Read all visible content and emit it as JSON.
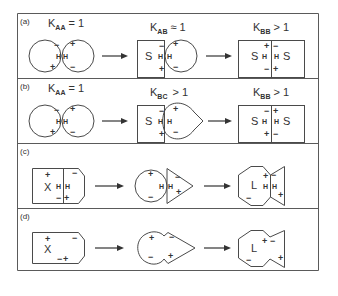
{
  "figure": {
    "panels": [
      {
        "id": "a",
        "label": "(a)",
        "steps": [
          {
            "k_main": "K",
            "k_sub": "AA",
            "k_rel": "= 1"
          },
          {
            "k_main": "K",
            "k_sub": "AB",
            "k_rel": "≈ 1"
          },
          {
            "k_main": "K",
            "k_sub": "BB",
            "k_rel": "> 1"
          }
        ],
        "shape_labels": {
          "s_left": "S",
          "s_right": "S",
          "s_mid": "S",
          "h": "H"
        }
      },
      {
        "id": "b",
        "label": "(b)",
        "steps": [
          {
            "k_main": "K",
            "k_sub": "AA",
            "k_rel": "= 1"
          },
          {
            "k_main": "K",
            "k_sub": "BC",
            "k_rel": "> 1"
          },
          {
            "k_main": "K",
            "k_sub": "BB",
            "k_rel": "> 1"
          }
        ],
        "shape_labels": {
          "s_left": "S",
          "s_right": "S",
          "s_mid": "S",
          "h": "H"
        }
      },
      {
        "id": "c",
        "label": "(c)",
        "shape_labels": {
          "x": "X",
          "l": "L",
          "h": "H"
        }
      },
      {
        "id": "d",
        "label": "(d)",
        "shape_labels": {
          "x": "X",
          "l": "L"
        }
      }
    ],
    "signs": {
      "plus": "+",
      "minus": "−"
    },
    "colors": {
      "line": "#4a4a4a",
      "text": "#333333",
      "background": "#ffffff"
    }
  }
}
